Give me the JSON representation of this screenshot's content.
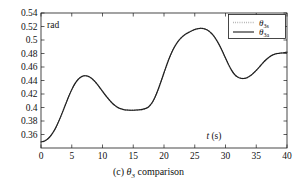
{
  "figure": {
    "caption_prefix": "(c)",
    "caption_symbol": "θ",
    "caption_symbol_sub": "3",
    "caption_text": "comparison",
    "unit_label": "rad"
  },
  "chart_data": {
    "type": "line",
    "title": "",
    "xlabel": "t (s)",
    "xlabel_symbol": "t",
    "xlabel_unit": "(s)",
    "ylabel": "rad",
    "xlim": [
      0,
      40
    ],
    "ylim": [
      0.34,
      0.54
    ],
    "grid": false,
    "legend_position": "top-right",
    "xticks": [
      0,
      5,
      10,
      15,
      20,
      25,
      30,
      35,
      40
    ],
    "xtick_labels": [
      "0",
      "5",
      "10",
      "15",
      "20",
      "25",
      "30",
      "35",
      "40"
    ],
    "yticks": [
      0.36,
      0.38,
      0.4,
      0.42,
      0.44,
      0.46,
      0.48,
      0.5,
      0.52,
      0.54
    ],
    "ytick_labels": [
      "0.36",
      "0.38",
      "0.4",
      "0.42",
      "0.44",
      "0.46",
      "0.48",
      "0.5",
      "0.52",
      "0.54"
    ],
    "x": [
      0,
      0.5,
      1,
      1.5,
      2,
      2.5,
      3,
      3.5,
      4,
      4.5,
      5,
      5.5,
      6,
      6.5,
      7,
      7.5,
      8,
      8.5,
      9,
      9.5,
      10,
      10.5,
      11,
      11.5,
      12,
      12.5,
      13,
      13.5,
      14,
      14.5,
      15,
      15.5,
      16,
      16.5,
      17,
      17.5,
      18,
      18.5,
      19,
      19.5,
      20,
      20.5,
      21,
      21.5,
      22,
      22.5,
      23,
      23.5,
      24,
      24.5,
      25,
      25.5,
      26,
      26.5,
      27,
      27.5,
      28,
      28.5,
      29,
      29.5,
      30,
      30.5,
      31,
      31.5,
      32,
      32.5,
      33,
      33.5,
      34,
      34.5,
      35,
      35.5,
      36,
      36.5,
      37,
      37.5,
      38,
      38.5,
      39,
      39.5,
      40
    ],
    "series": [
      {
        "name": "θ_3s",
        "symbol": "θ",
        "subscript": "3s",
        "style": "dotted",
        "color": "#8c8c8c",
        "values": [
          0.349,
          0.35,
          0.3527,
          0.3572,
          0.3636,
          0.372,
          0.382,
          0.3932,
          0.4048,
          0.4162,
          0.4265,
          0.435,
          0.4412,
          0.4452,
          0.447,
          0.4468,
          0.4447,
          0.441,
          0.436,
          0.4302,
          0.424,
          0.418,
          0.4124,
          0.4074,
          0.4032,
          0.4,
          0.398,
          0.3968,
          0.3962,
          0.396,
          0.396,
          0.3962,
          0.3966,
          0.3972,
          0.3984,
          0.401,
          0.4062,
          0.4145,
          0.4255,
          0.4382,
          0.4515,
          0.4645,
          0.4762,
          0.4862,
          0.4942,
          0.5004,
          0.505,
          0.5086,
          0.5112,
          0.5135,
          0.5155,
          0.5168,
          0.5173,
          0.5168,
          0.515,
          0.5118,
          0.507,
          0.5005,
          0.4925,
          0.4832,
          0.4732,
          0.4635,
          0.455,
          0.4487,
          0.445,
          0.4432,
          0.443,
          0.4442,
          0.4468,
          0.4505,
          0.455,
          0.46,
          0.4652,
          0.47,
          0.474,
          0.477,
          0.479,
          0.48,
          0.4806,
          0.4812,
          0.482
        ],
        "note": "nearly coincident with solid trace; visible only as faint dotted overlay"
      },
      {
        "name": "θ_3a",
        "symbol": "θ",
        "subscript": "3a",
        "style": "solid",
        "color": "#1a1a1a",
        "values": [
          0.349,
          0.35,
          0.3527,
          0.3572,
          0.3636,
          0.372,
          0.382,
          0.3932,
          0.4048,
          0.4162,
          0.4265,
          0.435,
          0.4412,
          0.4452,
          0.447,
          0.4468,
          0.4447,
          0.441,
          0.436,
          0.4302,
          0.424,
          0.418,
          0.4124,
          0.4074,
          0.4032,
          0.4,
          0.398,
          0.3968,
          0.3962,
          0.396,
          0.396,
          0.3962,
          0.3966,
          0.3972,
          0.3984,
          0.401,
          0.4062,
          0.4145,
          0.4255,
          0.4382,
          0.4515,
          0.4645,
          0.4762,
          0.4862,
          0.4942,
          0.5004,
          0.505,
          0.5086,
          0.5112,
          0.5135,
          0.5155,
          0.5168,
          0.5173,
          0.5168,
          0.515,
          0.5118,
          0.507,
          0.5005,
          0.4925,
          0.4832,
          0.4732,
          0.4635,
          0.455,
          0.4487,
          0.445,
          0.4432,
          0.443,
          0.4442,
          0.4468,
          0.4505,
          0.455,
          0.46,
          0.4652,
          0.47,
          0.474,
          0.477,
          0.479,
          0.48,
          0.4806,
          0.4812,
          0.482
        ],
        "note": "primary black trace"
      }
    ],
    "annotations": [
      {
        "text": "rad",
        "position": "inside-top-left"
      },
      {
        "text": "t (s)",
        "position": "inside-bottom-right"
      }
    ],
    "key_points": {
      "start": {
        "t": 0,
        "value": 0.349
      },
      "first_peak": {
        "t": 5.5,
        "value": 0.449
      },
      "first_trough": {
        "t": 12.0,
        "value": 0.396
      },
      "global_max": {
        "t": 19.5,
        "value": 0.517
      },
      "mid_dip": {
        "t": 25.5,
        "value": 0.443
      },
      "second_peak": {
        "t": 32.5,
        "value": 0.49
      },
      "end": {
        "t": 40,
        "value": 0.349
      }
    }
  },
  "legend": {
    "entries": [
      {
        "symbol": "θ",
        "sub": "3s",
        "style": "dotted"
      },
      {
        "symbol": "θ",
        "sub": "3a",
        "style": "solid"
      }
    ]
  }
}
